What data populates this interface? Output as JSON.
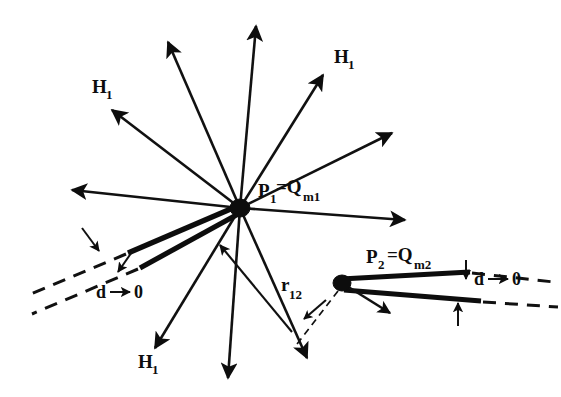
{
  "figure": {
    "name": "magnetic-monopole-pair-field-diagram",
    "background_color": "#ffffff",
    "ink_color": "#0d0d0d",
    "width": 561,
    "height": 397
  },
  "nodes": [
    {
      "id": "p1",
      "label_parts": {
        "main": "P",
        "sub": "1",
        "eq": "=Q",
        "sub2": "m1"
      },
      "label_text": "P1=Qm1",
      "x": 240,
      "y": 208,
      "radius": 9
    },
    {
      "id": "p2",
      "label_parts": {
        "main": "P",
        "sub": "2",
        "eq": "=Q",
        "sub2": "m2"
      },
      "label_text": "P2 =Qm2",
      "x": 342,
      "y": 283,
      "radius": 8
    }
  ],
  "labels": {
    "p1": {
      "base": "P",
      "sub": "1",
      "eq": "=Q",
      "sub2": "m1",
      "x": 262,
      "y": 196
    },
    "p2": {
      "base": "P",
      "sub": "2",
      "eq": "=Q",
      "sub2": "m2",
      "x": 372,
      "y": 262
    },
    "r12": {
      "base": "r",
      "sub": "12",
      "x": 286,
      "y": 292
    },
    "h1_upper_left": {
      "text": "H",
      "sub": "1",
      "x": 94,
      "y": 92
    },
    "h1_upper_right": {
      "text": "H",
      "sub": "1",
      "x": 337,
      "y": 62
    },
    "h1_lower_left": {
      "text": "H",
      "sub": "1",
      "x": 140,
      "y": 367
    },
    "d_left": {
      "text": "d",
      "arrow": "→",
      "zero": "0",
      "x": 106,
      "y": 296
    },
    "d_right": {
      "text": "d",
      "arrow": "→",
      "zero": "0",
      "x": 497,
      "y": 283
    }
  },
  "field_vectors": [
    {
      "name": "field-arrow-up-left-steep",
      "x1": 240,
      "y1": 208,
      "x2": 168,
      "y2": 42
    },
    {
      "name": "field-arrow-up-vertical",
      "x1": 240,
      "y1": 208,
      "x2": 256,
      "y2": 24
    },
    {
      "name": "field-arrow-up-right-h1",
      "x1": 240,
      "y1": 208,
      "x2": 323,
      "y2": 75
    },
    {
      "name": "field-arrow-up-left-h1",
      "x1": 240,
      "y1": 208,
      "x2": 110,
      "y2": 108
    },
    {
      "name": "field-arrow-right-upper",
      "x1": 240,
      "y1": 208,
      "x2": 392,
      "y2": 133
    },
    {
      "name": "field-arrow-left-flat",
      "x1": 240,
      "y1": 208,
      "x2": 70,
      "y2": 190
    },
    {
      "name": "field-arrow-right-flat",
      "x1": 240,
      "y1": 208,
      "x2": 405,
      "y2": 220
    },
    {
      "name": "field-arrow-down-left-h1",
      "x1": 240,
      "y1": 208,
      "x2": 155,
      "y2": 350
    },
    {
      "name": "field-arrow-down-vertical",
      "x1": 240,
      "y1": 208,
      "x2": 228,
      "y2": 380
    },
    {
      "name": "field-arrow-down-right",
      "x1": 240,
      "y1": 208,
      "x2": 307,
      "y2": 360
    },
    {
      "name": "field-arrow-inward-lower",
      "x1": 290,
      "y1": 330,
      "x2": 220,
      "y2": 245
    }
  ],
  "p2_vectors": [
    {
      "name": "p2-field-arrow-down-right",
      "x1": 342,
      "y1": 283,
      "x2": 390,
      "y2": 313
    }
  ],
  "r12_connector": {
    "name": "r12-dashed-connector",
    "x1": 338,
    "y1": 290,
    "x2": 296,
    "y2": 345,
    "arrow_x": 305,
    "arrow_y": 318
  },
  "plates": {
    "left_wedge": {
      "name": "left-wedge-plates",
      "upper": {
        "x1": 240,
        "y1": 206,
        "x2": 128,
        "y2": 253
      },
      "lower": {
        "x1": 240,
        "y1": 212,
        "x2": 140,
        "y2": 268
      },
      "dash_upper": {
        "x1": 126,
        "y1": 254,
        "x2": 28,
        "y2": 296
      },
      "dash_lower": {
        "x1": 138,
        "y1": 269,
        "x2": 34,
        "y2": 313
      }
    },
    "right_wedge": {
      "name": "right-wedge-plates",
      "upper": {
        "x1": 343,
        "y1": 279,
        "x2": 470,
        "y2": 272
      },
      "lower": {
        "x1": 345,
        "y1": 289,
        "x2": 480,
        "y2": 300
      },
      "dash_upper": {
        "x1": 472,
        "y1": 273,
        "x2": 552,
        "y2": 281
      },
      "dash_lower": {
        "x1": 482,
        "y1": 301,
        "x2": 556,
        "y2": 306
      }
    }
  },
  "gap_markers": {
    "left_upper": {
      "name": "left-gap-arrow-upper",
      "x1": 84,
      "y1": 230,
      "x2": 100,
      "y2": 252
    },
    "left_lower": {
      "name": "left-gap-arrow-lower",
      "x1": 132,
      "y1": 250,
      "x2": 118,
      "y2": 272
    },
    "right_upper": {
      "name": "right-gap-arrow-upper",
      "x1": 466,
      "y1": 262,
      "x2": 466,
      "y2": 280
    },
    "right_lower": {
      "name": "right-gap-arrow-lower",
      "x1": 458,
      "y1": 325,
      "x2": 458,
      "y2": 302
    }
  }
}
